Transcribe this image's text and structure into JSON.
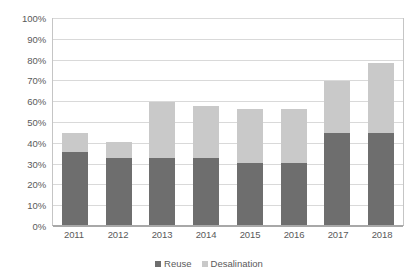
{
  "chart_data": {
    "type": "bar",
    "stacked": true,
    "title": "",
    "subtitle": "",
    "xlabel": "",
    "ylabel": "",
    "categories": [
      "2011",
      "2012",
      "2013",
      "2014",
      "2015",
      "2016",
      "2017",
      "2018"
    ],
    "series": [
      {
        "name": "Reuse",
        "color": "#6e6e6e",
        "values": [
          35,
          32,
          32,
          32,
          30,
          30,
          44,
          44
        ]
      },
      {
        "name": "Desalination",
        "color": "#c9c9c9",
        "values": [
          9,
          8,
          27,
          25,
          26,
          26,
          25,
          34
        ]
      }
    ],
    "totals": [
      44,
      40,
      59,
      57,
      56,
      56,
      69,
      78
    ],
    "ylim": [
      0,
      100
    ],
    "ytick_step": 10,
    "ytick_labels": [
      "0%",
      "10%",
      "20%",
      "30%",
      "40%",
      "50%",
      "60%",
      "70%",
      "80%",
      "90%",
      "100%"
    ],
    "ytick_values": [
      0,
      10,
      20,
      30,
      40,
      50,
      60,
      70,
      80,
      90,
      100
    ],
    "value_suffix": "%",
    "grid": true,
    "grid_orientation": "horizontal",
    "legend": {
      "position": "bottom",
      "entries": [
        {
          "label": "Reuse",
          "color": "#6e6e6e",
          "swatch_name": "legend-swatch-reuse"
        },
        {
          "label": "Desalination",
          "color": "#c9c9c9",
          "swatch_name": "legend-swatch-desalination"
        }
      ]
    },
    "colors": {
      "reuse": "#6e6e6e",
      "desalination": "#c9c9c9",
      "gridline": "#d9d9d9",
      "axis": "#a8a8a8",
      "tick_text": "#5a5a5a",
      "background": "#ffffff"
    }
  }
}
